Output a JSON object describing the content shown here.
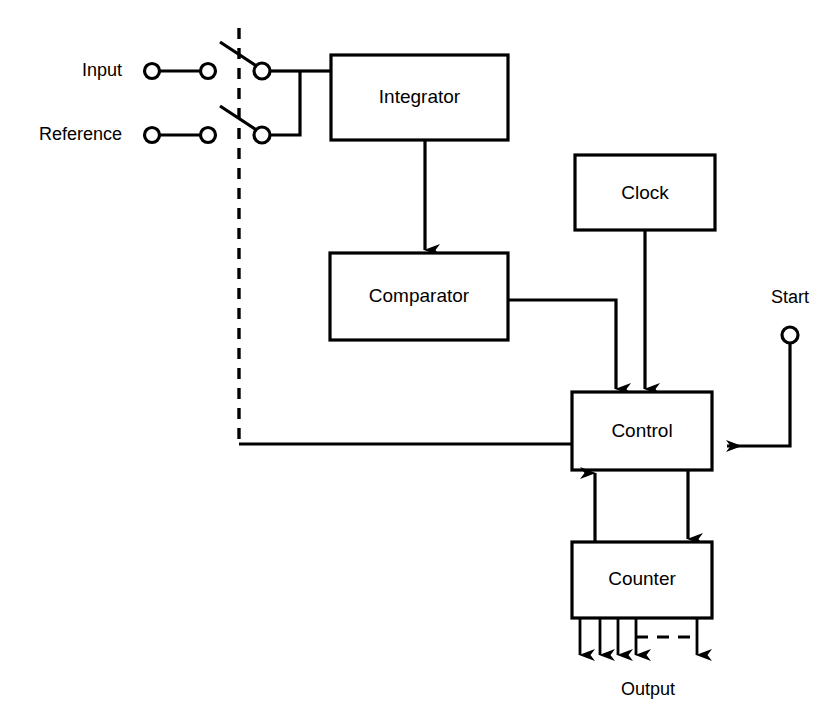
{
  "diagram": {
    "background_color": "#ffffff",
    "line_color": "#000000",
    "blocks": [
      {
        "id": "integrator",
        "label": "Integrator",
        "x": 331,
        "y": 55,
        "w": 177,
        "h": 85
      },
      {
        "id": "comparator",
        "label": "Comparator",
        "x": 330,
        "y": 253,
        "w": 178,
        "h": 87
      },
      {
        "id": "clock",
        "label": "Clock",
        "x": 575,
        "y": 155,
        "w": 140,
        "h": 75
      },
      {
        "id": "control",
        "label": "Control",
        "x": 572,
        "y": 392,
        "w": 140,
        "h": 78
      },
      {
        "id": "counter",
        "label": "Counter",
        "x": 572,
        "y": 542,
        "w": 140,
        "h": 76
      }
    ],
    "terminals": [
      {
        "id": "input-terminal-label",
        "label": "Input",
        "x": 78,
        "y": 71
      },
      {
        "id": "reference-terminal-label",
        "label": "Reference",
        "x": 133,
        "y": 135
      },
      {
        "id": "start-terminal-label",
        "label": "Start",
        "x": 790,
        "y": 298
      },
      {
        "id": "output-bus-label",
        "label": "Output",
        "x": 648,
        "y": 690
      }
    ],
    "switches": [
      {
        "id": "input-switch",
        "pivot_x": 222,
        "pivot_y": 41,
        "contact_x": 262,
        "contact_y": 71
      },
      {
        "id": "reference-switch",
        "pivot_x": 222,
        "pivot_y": 105,
        "contact_x": 262,
        "contact_y": 135
      }
    ],
    "output_arrow_count": 5,
    "notes": {
      "dashed_boundary": "vertical dashed line separating analog input terminals from switch contacts",
      "dashed_bus": "dashed continuation indicating additional output lines"
    }
  }
}
